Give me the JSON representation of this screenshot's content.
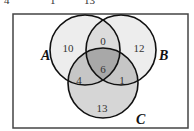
{
  "top_cutoff_text": [
    "4",
    "1",
    "13"
  ],
  "venn": {
    "sets": {
      "A": {
        "label": "A"
      },
      "B": {
        "label": "B"
      },
      "C": {
        "label": "C"
      }
    },
    "regions": {
      "A_only": "10",
      "B_only": "12",
      "C_only": "13",
      "A_and_B_only": "0",
      "A_and_C_only": "4",
      "B_and_C_only": "1",
      "A_and_B_and_C": "6"
    }
  },
  "colors": {
    "outline": "#111111",
    "single_fill": "#ededed",
    "double_fill": "#c9c9c9",
    "triple_fill": "#a8a8a8",
    "c_only_fill": "#d6d6d6",
    "frame": "#444444"
  }
}
